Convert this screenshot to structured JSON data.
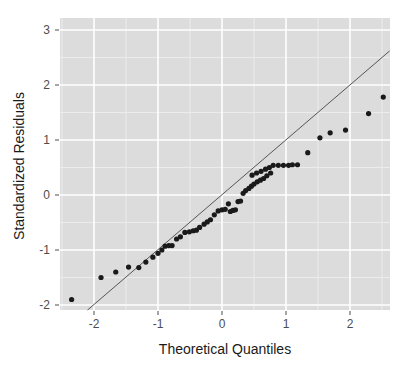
{
  "chart_data": {
    "type": "scatter",
    "title": "",
    "subtitle": "",
    "xlabel": "Theoretical Quantiles",
    "ylabel": "Standardized Residuals",
    "xlim": [
      -2.55,
      2.62
    ],
    "ylim": [
      -2.14,
      3.13
    ],
    "xticks": [
      -2,
      -1,
      0,
      1,
      2
    ],
    "xticklabels": [
      "-2",
      "-1",
      "0",
      "1",
      "2"
    ],
    "yticks": [
      -2,
      -1,
      0,
      1,
      2,
      3
    ],
    "yticklabels": [
      "-2",
      "-1",
      "0",
      "1",
      "2",
      "3"
    ],
    "grid": true,
    "grid_major_color": "#ffffff",
    "grid_minor_color": "#ececec",
    "panel_background": "#dcdcdc",
    "figure_background": "#ffffff",
    "legend": null,
    "legend_position": "none",
    "point_color": "#1a1a1a",
    "point_radius": 2.6,
    "reference_line": {
      "label": "qq-reference-line",
      "color": "#555555",
      "width": 1,
      "x0": -2.15,
      "y0": -2.14,
      "x1": 2.62,
      "y1": 2.62
    },
    "points": [
      {
        "x": -2.35,
        "y": -1.9
      },
      {
        "x": -1.89,
        "y": -1.5
      },
      {
        "x": -1.66,
        "y": -1.4
      },
      {
        "x": -1.46,
        "y": -1.31
      },
      {
        "x": -1.3,
        "y": -1.32
      },
      {
        "x": -1.19,
        "y": -1.22
      },
      {
        "x": -1.08,
        "y": -1.13
      },
      {
        "x": -1.0,
        "y": -1.06
      },
      {
        "x": -0.94,
        "y": -1.0
      },
      {
        "x": -0.89,
        "y": -0.93
      },
      {
        "x": -0.83,
        "y": -0.92
      },
      {
        "x": -0.78,
        "y": -0.92
      },
      {
        "x": -0.71,
        "y": -0.8
      },
      {
        "x": -0.65,
        "y": -0.76
      },
      {
        "x": -0.58,
        "y": -0.68
      },
      {
        "x": -0.51,
        "y": -0.67
      },
      {
        "x": -0.45,
        "y": -0.65
      },
      {
        "x": -0.4,
        "y": -0.64
      },
      {
        "x": -0.35,
        "y": -0.59
      },
      {
        "x": -0.28,
        "y": -0.53
      },
      {
        "x": -0.23,
        "y": -0.49
      },
      {
        "x": -0.18,
        "y": -0.45
      },
      {
        "x": -0.12,
        "y": -0.36
      },
      {
        "x": -0.06,
        "y": -0.29
      },
      {
        "x": 0.0,
        "y": -0.27
      },
      {
        "x": 0.05,
        "y": -0.26
      },
      {
        "x": 0.1,
        "y": -0.16
      },
      {
        "x": 0.13,
        "y": -0.3
      },
      {
        "x": 0.17,
        "y": -0.28
      },
      {
        "x": 0.21,
        "y": -0.27
      },
      {
        "x": 0.25,
        "y": -0.12
      },
      {
        "x": 0.29,
        "y": -0.11
      },
      {
        "x": 0.33,
        "y": 0.03
      },
      {
        "x": 0.37,
        "y": 0.08
      },
      {
        "x": 0.42,
        "y": 0.12
      },
      {
        "x": 0.46,
        "y": 0.16
      },
      {
        "x": 0.5,
        "y": 0.2
      },
      {
        "x": 0.55,
        "y": 0.24
      },
      {
        "x": 0.6,
        "y": 0.27
      },
      {
        "x": 0.65,
        "y": 0.3
      },
      {
        "x": 0.7,
        "y": 0.35
      },
      {
        "x": 0.76,
        "y": 0.4
      },
      {
        "x": 0.47,
        "y": 0.36
      },
      {
        "x": 0.54,
        "y": 0.4
      },
      {
        "x": 0.61,
        "y": 0.43
      },
      {
        "x": 0.68,
        "y": 0.47
      },
      {
        "x": 0.74,
        "y": 0.5
      },
      {
        "x": 0.8,
        "y": 0.54
      },
      {
        "x": 0.88,
        "y": 0.54
      },
      {
        "x": 0.96,
        "y": 0.54
      },
      {
        "x": 1.04,
        "y": 0.54
      },
      {
        "x": 1.1,
        "y": 0.55
      },
      {
        "x": 1.18,
        "y": 0.55
      },
      {
        "x": 1.34,
        "y": 0.77
      },
      {
        "x": 1.53,
        "y": 1.04
      },
      {
        "x": 1.69,
        "y": 1.13
      },
      {
        "x": 1.93,
        "y": 1.18
      },
      {
        "x": 2.29,
        "y": 1.48
      },
      {
        "x": 2.52,
        "y": 1.78
      },
      {
        "x": 3.04,
        "y": 1.78
      },
      {
        "x": 3.33,
        "y": 1.89
      },
      {
        "x": 3.87,
        "y": 2.9
      }
    ]
  },
  "plot": {
    "panel": {
      "x": 60,
      "y": 18,
      "width": 330,
      "height": 292
    },
    "scale": {
      "x_zero_px": 222,
      "x_unit_px": 64.0,
      "y_zero_px": 195,
      "y_unit_px": 55.0
    }
  }
}
